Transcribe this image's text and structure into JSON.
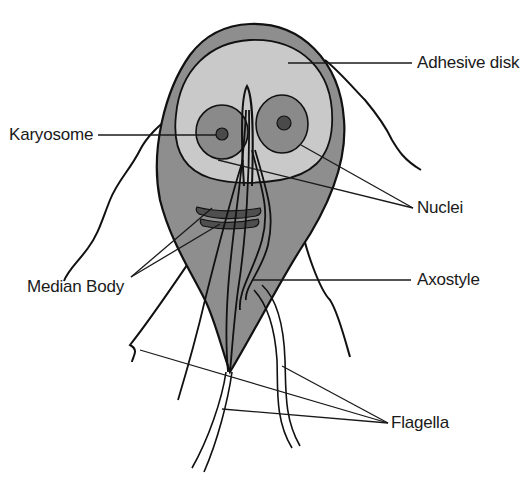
{
  "diagram": {
    "colors": {
      "body_fill": "#8e8e8e",
      "disk_fill": "#c9c9c9",
      "nucleus_fill": "#8a8a8a",
      "karyosome_fill": "#4a4a4a",
      "median_body_fill": "#4f4f4f",
      "outline": "#111111",
      "background": "#ffffff"
    },
    "labels": {
      "adhesive_disk": "Adhesive disk",
      "karyosome": "Karyosome",
      "nuclei": "Nuclei",
      "median_body": "Median Body",
      "axostyle": "Axostyle",
      "flagella": "Flagella"
    }
  }
}
